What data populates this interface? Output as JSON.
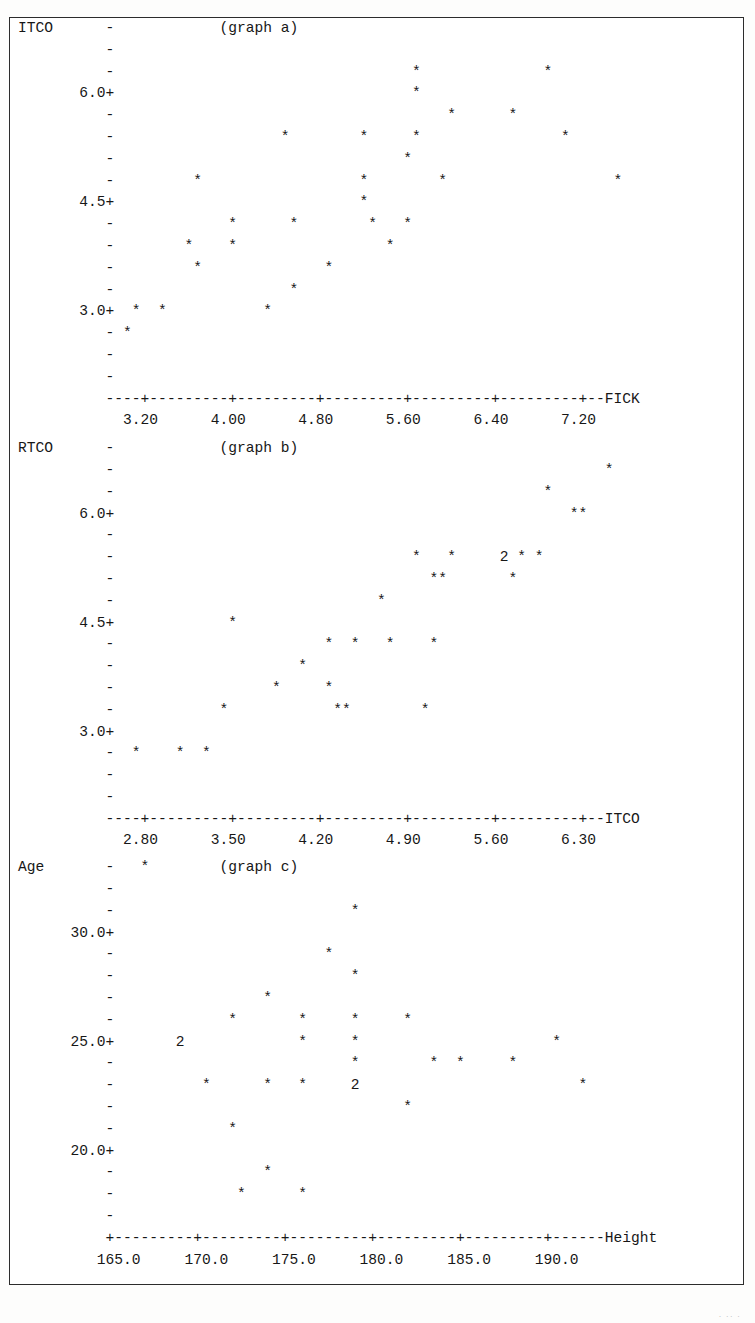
{
  "document": {
    "kind": "minitab-character-scatterplots",
    "tail_mark": "· ·· ·",
    "graph_count": 3
  },
  "chart_data": [
    {
      "id": "graph-a",
      "type": "scatter",
      "title": "(graph a)",
      "ylabel": "ITCO",
      "xlabel": "FICK",
      "y_tick_labels": [
        "6.0+",
        "4.5+",
        "3.0+"
      ],
      "x_tick_labels": [
        "3.20",
        "4.00",
        "4.80",
        "5.60",
        "6.40",
        "7.20"
      ],
      "xlim": [
        3.2,
        7.2
      ],
      "ylim": [
        3.0,
        6.0
      ],
      "grid": false,
      "legend": null,
      "marker": "*",
      "points": [
        {
          "x": 5.6,
          "y": 6.3
        },
        {
          "x": 7.0,
          "y": 6.3
        },
        {
          "x": 5.6,
          "y": 6.0
        },
        {
          "x": 6.0,
          "y": 5.7
        },
        {
          "x": 6.3,
          "y": 5.7
        },
        {
          "x": 4.6,
          "y": 5.4
        },
        {
          "x": 5.1,
          "y": 5.4
        },
        {
          "x": 5.3,
          "y": 5.4
        },
        {
          "x": 6.7,
          "y": 5.4
        },
        {
          "x": 5.5,
          "y": 5.1
        },
        {
          "x": 3.6,
          "y": 4.8
        },
        {
          "x": 5.25,
          "y": 4.8
        },
        {
          "x": 6.1,
          "y": 4.8
        },
        {
          "x": 7.4,
          "y": 4.8
        },
        {
          "x": 5.25,
          "y": 4.5
        },
        {
          "x": 3.9,
          "y": 4.2
        },
        {
          "x": 4.6,
          "y": 4.2
        },
        {
          "x": 5.0,
          "y": 4.2
        },
        {
          "x": 5.3,
          "y": 4.2
        },
        {
          "x": 3.65,
          "y": 3.9
        },
        {
          "x": 3.8,
          "y": 3.9
        },
        {
          "x": 5.1,
          "y": 3.9
        },
        {
          "x": 3.7,
          "y": 3.6
        },
        {
          "x": 4.7,
          "y": 3.6
        },
        {
          "x": 4.8,
          "y": 3.3
        },
        {
          "x": 3.1,
          "y": 3.0
        },
        {
          "x": 3.25,
          "y": 3.0
        },
        {
          "x": 4.05,
          "y": 3.0
        },
        {
          "x": 3.0,
          "y": 2.7
        }
      ],
      "rows": [
        "ITCO      -            (graph a)",
        "          -",
        "          -                                  *              *",
        "       6.0+                                  *",
        "          -                                      *      *",
        "          -                   *        *     *                *",
        "          -                                 *",
        "          -         *                  *        *                   *",
        "       4.5+                            *",
        "          -             *      *        *   *",
        "          -        *    *                 *",
        "          -         *              *",
        "          -                    *",
        "       3.0+  *  *           *",
        "          - *",
        "          -",
        "          -",
        "          ----+---------+---------+---------+---------+---------+--FICK",
        "            3.20      4.00      4.80      5.60      6.40      7.20"
      ]
    },
    {
      "id": "graph-b",
      "type": "scatter",
      "title": "(graph b)",
      "ylabel": "RTCO",
      "xlabel": "ITCO",
      "y_tick_labels": [
        "6.0+",
        "4.5+",
        "3.0+"
      ],
      "x_tick_labels": [
        "2.80",
        "3.50",
        "4.20",
        "4.90",
        "5.60",
        "6.30"
      ],
      "xlim": [
        2.8,
        6.3
      ],
      "ylim": [
        3.0,
        6.0
      ],
      "grid": false,
      "legend": null,
      "marker": "*",
      "overlap_marker": "2",
      "points": [
        {
          "x": 6.5,
          "y": 6.6
        },
        {
          "x": 5.8,
          "y": 6.3
        },
        {
          "x": 6.1,
          "y": 6.0
        },
        {
          "x": 6.2,
          "y": 6.0
        },
        {
          "x": 4.8,
          "y": 5.4
        },
        {
          "x": 5.0,
          "y": 5.4
        },
        {
          "x": 5.35,
          "y": 5.4,
          "count": 2
        },
        {
          "x": 5.45,
          "y": 5.4
        },
        {
          "x": 5.6,
          "y": 5.4
        },
        {
          "x": 4.95,
          "y": 5.1
        },
        {
          "x": 5.05,
          "y": 5.1
        },
        {
          "x": 5.55,
          "y": 5.1
        },
        {
          "x": 4.4,
          "y": 4.8
        },
        {
          "x": 3.3,
          "y": 4.5
        },
        {
          "x": 4.1,
          "y": 4.2
        },
        {
          "x": 4.25,
          "y": 4.2
        },
        {
          "x": 4.4,
          "y": 4.2
        },
        {
          "x": 4.6,
          "y": 4.2
        },
        {
          "x": 3.95,
          "y": 3.9
        },
        {
          "x": 3.75,
          "y": 3.6
        },
        {
          "x": 4.0,
          "y": 3.6
        },
        {
          "x": 3.4,
          "y": 3.3
        },
        {
          "x": 3.95,
          "y": 3.3
        },
        {
          "x": 4.05,
          "y": 3.3
        },
        {
          "x": 4.35,
          "y": 3.3
        },
        {
          "x": 2.8,
          "y": 2.7
        },
        {
          "x": 3.05,
          "y": 2.7
        },
        {
          "x": 3.2,
          "y": 2.7
        }
      ],
      "rows": [
        "RTCO      -            (graph b)",
        "          -                                                        *",
        "          -                                                 *",
        "       6.0+                                                    **",
        "          -",
        "          -                                  *   *     2 * *",
        "          -                                    **       *",
        "          -                              *",
        "       4.5+             *",
        "          -                        *  *   *    *",
        "          -                     *",
        "          -                  *     *",
        "          -            *            **        *",
        "       3.0+",
        "          -  *    *  *",
        "          -",
        "          -",
        "          ----+---------+---------+---------+---------+---------+--ITCO",
        "            2.80      3.50      4.20      4.90      5.60      6.30"
      ]
    },
    {
      "id": "graph-c",
      "type": "scatter",
      "title": "(graph c)",
      "ylabel": "Age",
      "xlabel": "Height",
      "y_tick_labels": [
        "30.0+",
        "25.0+",
        "20.0+"
      ],
      "x_tick_labels": [
        "165.0",
        "170.0",
        "175.0",
        "180.0",
        "185.0",
        "190.0"
      ],
      "xlim": [
        165.0,
        190.0
      ],
      "ylim": [
        20.0,
        30.0
      ],
      "grid": false,
      "legend": null,
      "marker": "*",
      "overlap_marker": "2",
      "points": [
        {
          "x": 167.0,
          "y": 32.5
        },
        {
          "x": 181.0,
          "y": 31.5
        },
        {
          "x": 179.0,
          "y": 29.0
        },
        {
          "x": 181.0,
          "y": 28.0
        },
        {
          "x": 175.0,
          "y": 27.0
        },
        {
          "x": 174.0,
          "y": 26.0
        },
        {
          "x": 177.0,
          "y": 26.0
        },
        {
          "x": 181.0,
          "y": 26.0
        },
        {
          "x": 184.0,
          "y": 26.0
        },
        {
          "x": 171.5,
          "y": 25.0,
          "count": 2
        },
        {
          "x": 177.0,
          "y": 25.0
        },
        {
          "x": 181.0,
          "y": 25.0
        },
        {
          "x": 192.0,
          "y": 25.0
        },
        {
          "x": 181.0,
          "y": 24.0
        },
        {
          "x": 186.5,
          "y": 24.0
        },
        {
          "x": 187.5,
          "y": 24.0
        },
        {
          "x": 189.0,
          "y": 24.0
        },
        {
          "x": 171.0,
          "y": 23.0
        },
        {
          "x": 175.0,
          "y": 23.0
        },
        {
          "x": 177.0,
          "y": 23.0
        },
        {
          "x": 180.0,
          "y": 23.0,
          "count": 2
        },
        {
          "x": 194.0,
          "y": 23.0
        },
        {
          "x": 184.0,
          "y": 22.0
        },
        {
          "x": 175.0,
          "y": 21.0
        },
        {
          "x": 178.5,
          "y": 19.0
        },
        {
          "x": 176.5,
          "y": 18.0
        },
        {
          "x": 179.5,
          "y": 18.0
        }
      ],
      "rows": [
        "Age       -   *        (graph c)",
        "          -",
        "          -                           *",
        "      30.0+",
        "          -                        *",
        "          -                           *",
        "          -                 *",
        "          -             *       *     *     *",
        "      25.0+       2             *     *                      *",
        "          -                           *        *  *     *",
        "          -          *      *   *     2                         *",
        "          -                                 *",
        "          -             *",
        "      20.0+",
        "          -                 *",
        "          -              *      *",
        "          -",
        "          +---------+---------+---------+---------+---------+------Height",
        "         165.0     170.0     175.0     180.0     185.0     190.0"
      ]
    }
  ]
}
